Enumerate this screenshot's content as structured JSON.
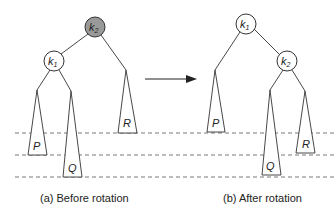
{
  "colors": {
    "line": "#333333",
    "highlight_fill": "#999999",
    "node_fill": "#ffffff",
    "background": "#ffffff"
  },
  "before": {
    "caption": "(a) Before rotation",
    "nodes": [
      {
        "id": "k2",
        "label": "k",
        "subscript": "2",
        "highlighted": true
      },
      {
        "id": "k1",
        "label": "k",
        "subscript": "1",
        "highlighted": false
      }
    ],
    "subtrees": [
      {
        "id": "P",
        "label": "P"
      },
      {
        "id": "Q",
        "label": "Q"
      },
      {
        "id": "R",
        "label": "R"
      }
    ]
  },
  "after": {
    "caption": "(b) After rotation",
    "nodes": [
      {
        "id": "k1",
        "label": "k",
        "subscript": "1",
        "highlighted": false
      },
      {
        "id": "k2",
        "label": "k",
        "subscript": "2",
        "highlighted": false
      }
    ],
    "subtrees": [
      {
        "id": "P",
        "label": "P"
      },
      {
        "id": "Q",
        "label": "Q"
      },
      {
        "id": "R",
        "label": "R"
      }
    ]
  },
  "arrow": {
    "direction": "right"
  },
  "level_lines": 3
}
